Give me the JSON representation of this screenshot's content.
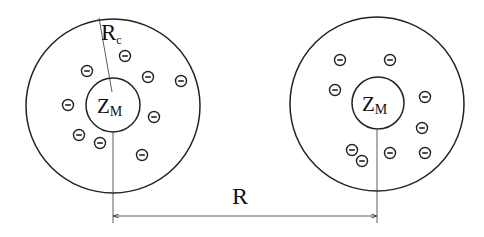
{
  "diagram": {
    "colors": {
      "stroke": "#222222",
      "background": "#ffffff"
    },
    "cells": [
      {
        "id": "left-cell",
        "outer": {
          "cx": 113,
          "cy": 106,
          "r": 87
        },
        "inner": {
          "cx": 113,
          "cy": 105,
          "r": 27
        },
        "macroion_label": "Z",
        "macroion_subscript": "M",
        "radius_label": "R",
        "radius_subscript": "c",
        "counterions": [
          {
            "x": 125,
            "y": 56
          },
          {
            "x": 87,
            "y": 71
          },
          {
            "x": 148,
            "y": 77
          },
          {
            "x": 181,
            "y": 81
          },
          {
            "x": 68,
            "y": 105
          },
          {
            "x": 154,
            "y": 117
          },
          {
            "x": 79,
            "y": 135
          },
          {
            "x": 100,
            "y": 143
          },
          {
            "x": 142,
            "y": 155
          }
        ]
      },
      {
        "id": "right-cell",
        "outer": {
          "cx": 377,
          "cy": 104,
          "r": 87
        },
        "inner": {
          "cx": 378,
          "cy": 103,
          "r": 26
        },
        "macroion_label": "Z",
        "macroion_subscript": "M",
        "counterions": [
          {
            "x": 340,
            "y": 60
          },
          {
            "x": 390,
            "y": 60
          },
          {
            "x": 335,
            "y": 90
          },
          {
            "x": 425,
            "y": 97
          },
          {
            "x": 422,
            "y": 128
          },
          {
            "x": 352,
            "y": 150
          },
          {
            "x": 362,
            "y": 161
          },
          {
            "x": 390,
            "y": 153
          },
          {
            "x": 425,
            "y": 153
          }
        ]
      }
    ],
    "counterion_symbol": "−",
    "separation_label": "R"
  }
}
